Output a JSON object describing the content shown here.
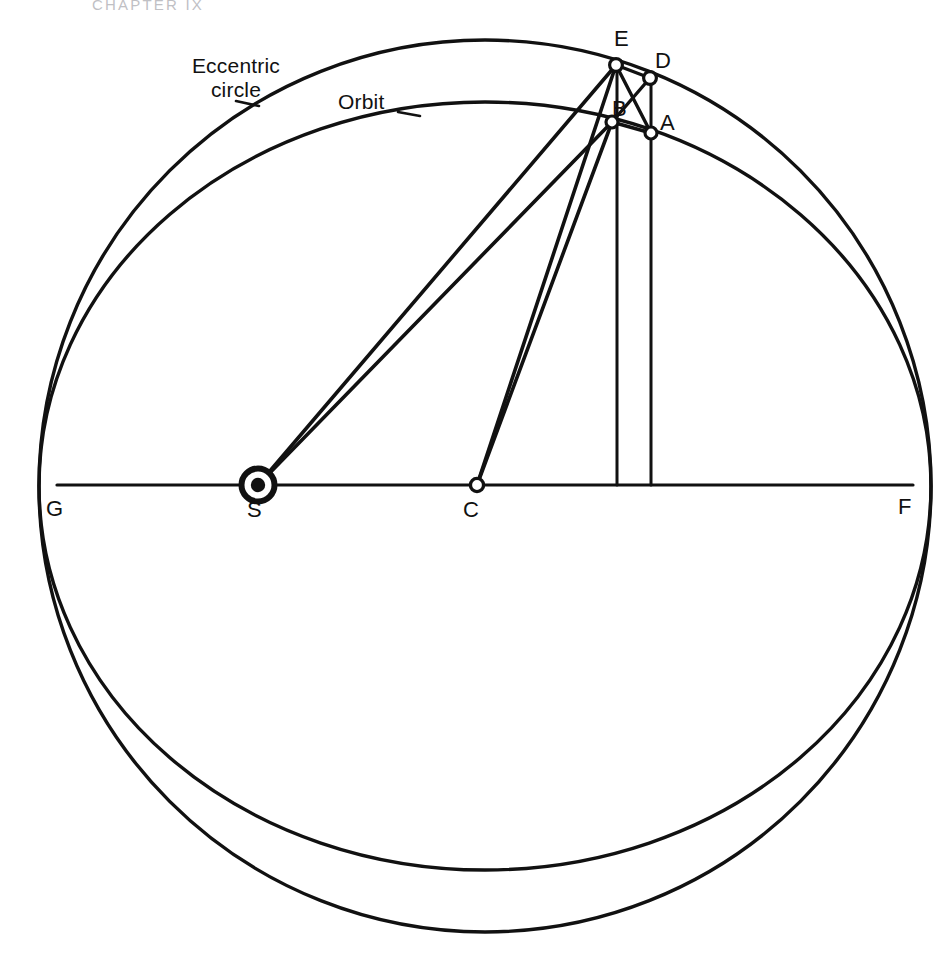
{
  "running_head": {
    "text": "CHAPTER IX"
  },
  "figure": {
    "type": "geometric-astronomy-diagram",
    "curve_labels": {
      "eccentric_circle_line1": "Eccentric",
      "eccentric_circle_line2": "circle",
      "orbit": "Orbit"
    },
    "point_labels": {
      "A": "A",
      "B": "B",
      "C": "C",
      "D": "D",
      "E": "E",
      "F": "F",
      "G": "G",
      "S": "S"
    },
    "colors": {
      "ink": "#111111",
      "paper": "#ffffff",
      "running_head": "#8d8d95"
    },
    "geometry": {
      "eccentric_circle": {
        "cx": 485,
        "cy": 486,
        "r": 446
      },
      "orbit_ellipse": {
        "cx": 485,
        "cy": 486,
        "rx": 446,
        "ry": 384
      },
      "axis_line": {
        "x1": 57,
        "y1": 485,
        "x2": 913,
        "y2": 485
      },
      "points": {
        "G": {
          "x": 57,
          "y": 485,
          "marker": "none"
        },
        "F": {
          "x": 913,
          "y": 485,
          "marker": "none"
        },
        "S": {
          "x": 258,
          "y": 485,
          "marker": "sun"
        },
        "C": {
          "x": 477,
          "y": 485,
          "marker": "open-circle"
        },
        "E": {
          "x": 616,
          "y": 65,
          "marker": "open-circle"
        },
        "D": {
          "x": 650,
          "y": 78,
          "marker": "open-circle"
        },
        "B": {
          "x": 612,
          "y": 122,
          "marker": "open-circle"
        },
        "A": {
          "x": 651,
          "y": 133,
          "marker": "open-circle"
        }
      },
      "segments": [
        {
          "from": "S",
          "to": "E"
        },
        {
          "from": "S",
          "to": "B"
        },
        {
          "from": "C",
          "to": "E"
        },
        {
          "from": "C",
          "to": "B"
        },
        {
          "from": "E",
          "to": "D"
        },
        {
          "from": "E",
          "to": "A"
        },
        {
          "from": "B",
          "to": "A"
        },
        {
          "from": "B",
          "to": "D"
        },
        {
          "from": "E",
          "to": "vertical-foot-617"
        },
        {
          "from": "D",
          "to": "vertical-foot-651"
        }
      ]
    }
  }
}
